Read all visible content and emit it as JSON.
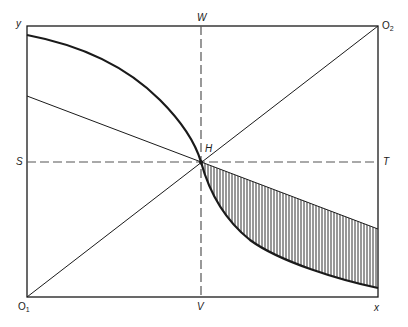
{
  "diagram": {
    "type": "edgeworth-box",
    "colors": {
      "stroke": "#1a1a1a",
      "dash": "#555555",
      "hatch": "#333333",
      "background": "#ffffff"
    },
    "labels": {
      "y": "y",
      "W": "W",
      "O2_main": "O",
      "O2_sub": "2",
      "S": "S",
      "H": "H",
      "T": "T",
      "O1_main": "O",
      "O1_sub": "1",
      "V": "V",
      "x": "x"
    }
  }
}
